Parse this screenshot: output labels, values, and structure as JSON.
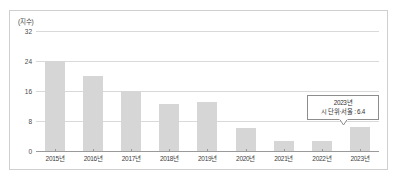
{
  "chart_data": {
    "type": "bar",
    "title": "",
    "subtitle": "",
    "xlabel": "",
    "ylabel": "",
    "unit_label": "(지수)",
    "categories": [
      "2015년",
      "2016년",
      "2017년",
      "2018년",
      "2019년",
      "2020년",
      "2021년",
      "2022년",
      "2023년"
    ],
    "values": [
      24.0,
      20.0,
      16.0,
      12.6,
      13.0,
      6.2,
      2.6,
      2.7,
      6.4
    ],
    "series": [
      {
        "name": "지수",
        "values": [
          24.0,
          20.0,
          16.0,
          12.6,
          13.0,
          6.2,
          2.6,
          2.7,
          6.4
        ]
      }
    ],
    "ylim": [
      0,
      32
    ],
    "yticks": [
      0,
      8,
      16,
      24,
      32
    ],
    "ytick_labels": [
      "0",
      "8",
      "16",
      "24",
      "32"
    ],
    "grid": true,
    "legend": false,
    "legend_position": "none",
    "bar_color": "#d6d6d6",
    "gridline_color": "#d9d9d9",
    "axis_color": "#9a9a9a",
    "annotations": [
      {
        "target_category": "2023년",
        "line1": "2023년",
        "line2": "시 단위·서울 : 6.4",
        "value": 6.4
      }
    ]
  },
  "figure": {
    "border_color": "#cfcfcf",
    "background": "#ffffff"
  }
}
